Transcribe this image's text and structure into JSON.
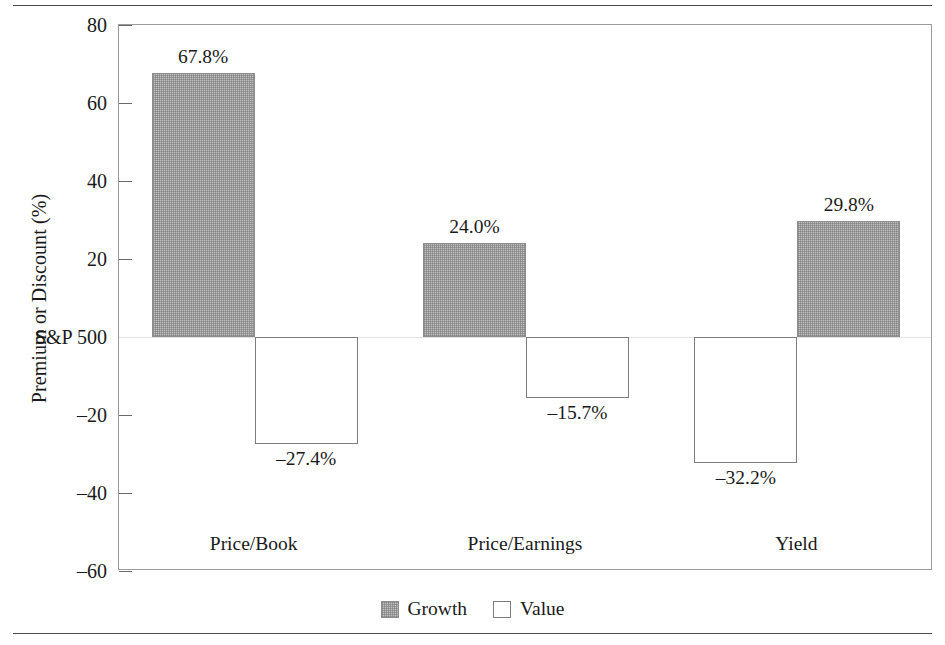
{
  "chart_data": {
    "type": "bar",
    "title": "",
    "xlabel": "",
    "ylabel": "Premium or Discount (%)",
    "categories": [
      "Price/Book",
      "Price/Earnings",
      "Yield"
    ],
    "series": [
      {
        "name": "Growth",
        "values": [
          67.8,
          24.0,
          29.8
        ],
        "labels": [
          "67.8%",
          "24.0%",
          "29.8%"
        ],
        "color": "#c0c0c0",
        "fill": "checkered-gray"
      },
      {
        "name": "Value",
        "values": [
          -27.4,
          -15.7,
          -32.2
        ],
        "labels": [
          "–27.4%",
          "–15.7%",
          "–32.2%"
        ],
        "color": "#ffffff",
        "fill": "white"
      }
    ],
    "group_bar_order": [
      [
        "Growth",
        "Value"
      ],
      [
        "Growth",
        "Value"
      ],
      [
        "Value",
        "Growth"
      ]
    ],
    "ylim": [
      -60,
      80
    ],
    "ytick_values": [
      80,
      60,
      40,
      20,
      0,
      -20,
      -40,
      -60
    ],
    "ytick_labels": [
      "80",
      "60",
      "40",
      "20",
      "S&P 500",
      "–20",
      "–40",
      "–60"
    ],
    "zero_tick_label": "S&P 500",
    "grid": false,
    "legend_position": "bottom-center",
    "legend_entries": [
      "Growth",
      "Value"
    ]
  },
  "axis": {
    "y_title": "Premium or Discount (%)"
  },
  "legend": {
    "growth_label": "Growth",
    "value_label": "Value"
  }
}
